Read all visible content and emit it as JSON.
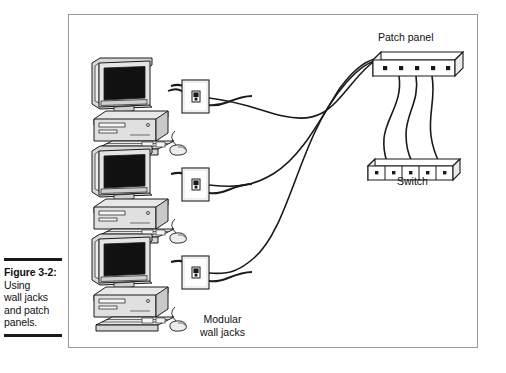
{
  "caption": {
    "figure_number": "Figure 3-2:",
    "lines": [
      "Using",
      "wall jacks",
      "and patch",
      "panels."
    ]
  },
  "figure": {
    "labels": {
      "patch_panel": "Patch panel",
      "switch": "Switch",
      "modular_wall_jacks_line1": "Modular",
      "modular_wall_jacks_line2": "wall jacks"
    },
    "devices": {
      "computers": [
        {
          "name": "workstation-top"
        },
        {
          "name": "workstation-middle"
        },
        {
          "name": "workstation-bottom"
        }
      ],
      "wall_jacks": [
        {
          "name": "wall-jack-top"
        },
        {
          "name": "wall-jack-middle"
        },
        {
          "name": "wall-jack-bottom"
        }
      ],
      "patch_panel": {
        "ports": 5
      },
      "switch": {
        "ports": 5
      },
      "patch_cords": 3,
      "horizontal_runs": 3
    },
    "colors": {
      "line": "#1a1a1a",
      "frame": "#9a9a9a",
      "device_fill": "#ffffff",
      "screen": "#111111",
      "chassis_shade": "#d8d8d8",
      "chassis_light": "#ededed"
    }
  }
}
